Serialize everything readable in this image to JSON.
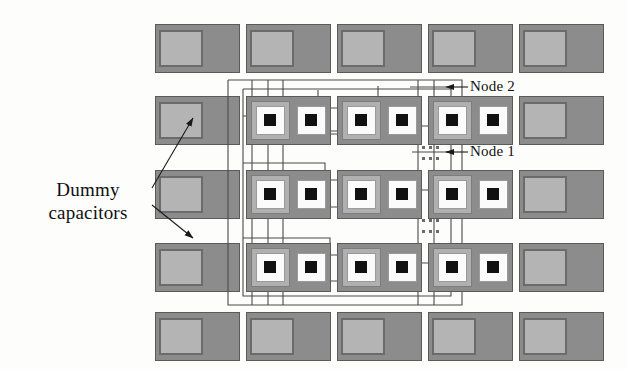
{
  "figure": {
    "kind": "ic-layout-diagram",
    "background_color": "#fdfdfb"
  },
  "labels": {
    "node2": "Node 2",
    "node1": "Node 1",
    "dummy": "Dummy capacitors"
  },
  "colors": {
    "plate_dark": "#8c8c8c",
    "plate_dark_edge": "#5a5a5a",
    "dummy_inner": "#b4b4b4",
    "dummy_inner_edge": "#6b6b6b",
    "cell_ring_light": "#b0b0b0",
    "cell_ring_white": "#fbfbfb",
    "cell_core": "#111111",
    "wire": "#4a4a4a",
    "text": "#101010",
    "arrow": "#1a1a1a"
  },
  "grid": {
    "columns": 5,
    "rows": 5,
    "column_x": [
      155,
      246,
      337,
      428,
      519
    ],
    "row_y": [
      24,
      96,
      170,
      243,
      312
    ],
    "cell_width": 84,
    "cell_height": 48,
    "dummy_positions": [
      {
        "row": 0,
        "col": 0
      },
      {
        "row": 0,
        "col": 1
      },
      {
        "row": 0,
        "col": 2
      },
      {
        "row": 0,
        "col": 3
      },
      {
        "row": 0,
        "col": 4
      },
      {
        "row": 1,
        "col": 0
      },
      {
        "row": 1,
        "col": 4
      },
      {
        "row": 2,
        "col": 0
      },
      {
        "row": 2,
        "col": 4
      },
      {
        "row": 3,
        "col": 0
      },
      {
        "row": 3,
        "col": 4
      },
      {
        "row": 4,
        "col": 0
      },
      {
        "row": 4,
        "col": 1
      },
      {
        "row": 4,
        "col": 2
      },
      {
        "row": 4,
        "col": 3
      },
      {
        "row": 4,
        "col": 4
      }
    ],
    "active_positions": [
      {
        "row": 1,
        "col": 1
      },
      {
        "row": 1,
        "col": 2
      },
      {
        "row": 1,
        "col": 3
      },
      {
        "row": 2,
        "col": 1
      },
      {
        "row": 2,
        "col": 2
      },
      {
        "row": 2,
        "col": 3
      },
      {
        "row": 3,
        "col": 1
      },
      {
        "row": 3,
        "col": 2
      },
      {
        "row": 3,
        "col": 3
      }
    ]
  },
  "annotations": {
    "node2_arrow": {
      "from_x": 468,
      "to_x": 446,
      "y": 87
    },
    "node1_arrow": {
      "from_x": 468,
      "to_x": 446,
      "y": 152
    },
    "dummy_arrow_upper": {
      "from_x": 152,
      "from_y": 188,
      "to_x": 193,
      "to_y": 118
    },
    "dummy_arrow_lower": {
      "from_x": 152,
      "from_y": 205,
      "to_x": 193,
      "to_y": 238
    }
  },
  "continuation_marks": {
    "note": "dotted ellipsis marks indicating repeated routing between rows",
    "groups": [
      {
        "x": 430,
        "y": 152,
        "rows": 2,
        "dots": 3
      },
      {
        "x": 430,
        "y": 225,
        "rows": 2,
        "dots": 3
      }
    ]
  }
}
